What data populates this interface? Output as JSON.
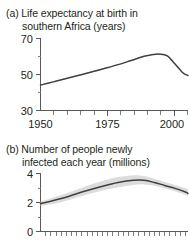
{
  "figure": {
    "background_color": "#ffffff",
    "line_color": "#3f3f3f",
    "band_color": "#cfcfcf",
    "axis_color": "#58595b"
  },
  "panel_a": {
    "caption_line1": "(a) Life expectancy at birth in",
    "caption_line2": "southern Africa (years)",
    "y_tick_labels": [
      "70",
      "50",
      "30"
    ],
    "x_tick_labels": [
      "1950",
      "1975",
      "2000"
    ]
  },
  "panel_b": {
    "caption_line1": "(b) Number of people newly",
    "caption_line2": "infected each year (millions)",
    "y_tick_labels": [
      "4",
      "2",
      "0"
    ],
    "x_tick_labels": []
  },
  "chart_data": [
    {
      "id": "panel-a",
      "type": "line",
      "title": "(a) Life expectancy at birth in southern Africa (years)",
      "xlabel": "",
      "ylabel": "years",
      "xlim": [
        1950,
        2007
      ],
      "ylim": [
        30,
        70
      ],
      "y_ticks": [
        30,
        40,
        50,
        60,
        70
      ],
      "y_tick_labels_shown": [
        30,
        50,
        70
      ],
      "x_ticks": [
        1950,
        1955,
        1960,
        1965,
        1970,
        1975,
        1980,
        1985,
        1990,
        1995,
        2000,
        2005
      ],
      "x_tick_labels_shown": [
        1950,
        1975,
        2000
      ],
      "grid": false,
      "legend": "none",
      "series": [
        {
          "name": "Life expectancy",
          "x": [
            1950,
            1955,
            1960,
            1965,
            1970,
            1975,
            1980,
            1985,
            1990,
            1993,
            1996,
            1999,
            2002,
            2005,
            2007
          ],
          "values": [
            44.0,
            45.8,
            47.6,
            49.5,
            51.4,
            53.3,
            55.3,
            57.6,
            59.9,
            60.8,
            61.1,
            60.2,
            55.6,
            50.8,
            49.3
          ]
        }
      ]
    },
    {
      "id": "panel-b",
      "type": "line",
      "title": "(b) Number of people newly infected each year (millions)",
      "xlabel": "",
      "ylabel": "millions",
      "xlim": [
        1950,
        2007
      ],
      "ylim": [
        0,
        4
      ],
      "y_ticks": [
        0,
        1,
        2,
        3,
        4
      ],
      "y_tick_labels_shown": [
        0,
        2,
        4
      ],
      "x_ticks": [
        1950,
        1952,
        1954,
        1956,
        1958,
        1960,
        1962,
        1964,
        1966,
        1968,
        1970,
        1972,
        1974,
        1976,
        1978,
        1980,
        1982,
        1984,
        1986,
        1988,
        1990,
        1992,
        1994,
        1996,
        1998,
        2000,
        2002,
        2004,
        2006
      ],
      "x_tick_labels_shown": [],
      "grid": false,
      "legend": "none",
      "series": [
        {
          "name": "Newly infected (estimate)",
          "x": [
            1950,
            1958,
            1966,
            1974,
            1980,
            1986,
            1990,
            1994,
            1998,
            2002,
            2006,
            2007
          ],
          "values": [
            1.9,
            2.25,
            2.7,
            3.1,
            3.35,
            3.5,
            3.5,
            3.35,
            3.15,
            2.95,
            2.7,
            2.6
          ]
        }
      ],
      "uncertainty_band": {
        "name": "Uncertainty range",
        "x": [
          1950,
          1958,
          1966,
          1974,
          1980,
          1986,
          1990,
          1994,
          1998,
          2002,
          2006,
          2007
        ],
        "upper": [
          2.05,
          2.5,
          3.0,
          3.45,
          3.72,
          3.85,
          3.8,
          3.6,
          3.38,
          3.18,
          2.95,
          2.88
        ],
        "lower": [
          1.75,
          2.0,
          2.42,
          2.8,
          3.02,
          3.18,
          3.22,
          3.12,
          2.95,
          2.75,
          2.5,
          2.38
        ]
      }
    }
  ]
}
